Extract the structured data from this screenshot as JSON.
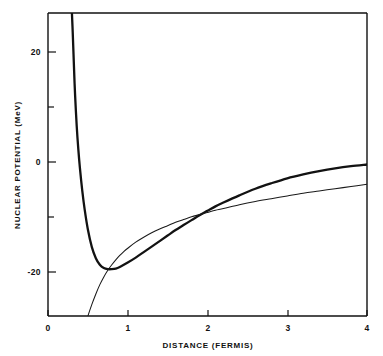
{
  "chart_data": {
    "type": "line",
    "title": "",
    "xlabel": "DISTANCE (FERMIS)",
    "ylabel": "NUCLEAR POTENTIAL (MeV)",
    "xlim": [
      0,
      4
    ],
    "ylim": [
      -27.5,
      27.5
    ],
    "grid": false,
    "legend": "none",
    "xticks": [
      0,
      1,
      2,
      3,
      4
    ],
    "xticklabels": [
      "0",
      "1",
      "2",
      "3",
      "4"
    ],
    "yticks": [
      -20,
      -10,
      0,
      10,
      20
    ],
    "yticklabels": [
      "-20",
      "",
      "0",
      "",
      "20"
    ],
    "y_major_labeled": [
      "20",
      "0",
      "-20"
    ],
    "y_minor_unlabeled": [
      10,
      -10
    ],
    "series": [
      {
        "name": "hard-core-potential",
        "style": "thick",
        "description": "Repulsive hard core near 0.3 fermis, attractive well minimum about -19 MeV near 0.8 fermis, tending to 0 MeV at large distance",
        "x": [
          0.3,
          0.31,
          0.32,
          0.33,
          0.34,
          0.36,
          0.38,
          0.4,
          0.43,
          0.46,
          0.5,
          0.55,
          0.6,
          0.65,
          0.7,
          0.75,
          0.8,
          0.85,
          0.9,
          1.0,
          1.1,
          1.2,
          1.3,
          1.4,
          1.5,
          1.6,
          1.7,
          1.8,
          1.9,
          2.0,
          2.1,
          2.2,
          2.4,
          2.6,
          2.8,
          3.0,
          3.2,
          3.4,
          3.6,
          3.8,
          4.0
        ],
        "y": [
          27.5,
          24.0,
          20.0,
          16.0,
          12.5,
          7.0,
          2.8,
          -0.6,
          -4.8,
          -8.2,
          -11.8,
          -15.0,
          -17.0,
          -18.2,
          -18.8,
          -19.0,
          -19.0,
          -18.9,
          -18.6,
          -17.8,
          -16.9,
          -15.9,
          -14.9,
          -13.9,
          -12.9,
          -11.9,
          -11.0,
          -10.1,
          -9.2,
          -8.4,
          -7.6,
          -6.9,
          -5.6,
          -4.4,
          -3.4,
          -2.5,
          -1.8,
          -1.2,
          -0.7,
          -0.3,
          0.0
        ]
      },
      {
        "name": "soft-potential",
        "style": "thin",
        "description": "Monotonic attractive potential rising from below -27 MeV near 0.5 fermis to about -3.5 MeV at 4 fermis",
        "x": [
          0.5,
          0.55,
          0.6,
          0.65,
          0.7,
          0.75,
          0.8,
          0.85,
          0.9,
          0.95,
          1.0,
          1.1,
          1.2,
          1.3,
          1.4,
          1.5,
          1.6,
          1.7,
          1.8,
          1.9,
          2.0,
          2.1,
          2.2,
          2.4,
          2.6,
          2.8,
          3.0,
          3.2,
          3.4,
          3.6,
          3.8,
          4.0
        ],
        "y": [
          -27.5,
          -25.4,
          -23.5,
          -21.8,
          -20.4,
          -19.2,
          -18.2,
          -17.3,
          -16.5,
          -15.8,
          -15.2,
          -14.1,
          -13.2,
          -12.4,
          -11.7,
          -11.1,
          -10.5,
          -10.0,
          -9.5,
          -9.1,
          -8.7,
          -8.3,
          -8.0,
          -7.3,
          -6.7,
          -6.2,
          -5.7,
          -5.2,
          -4.8,
          -4.4,
          -4.0,
          -3.6
        ]
      }
    ],
    "annotations": {
      "curve_crossing_1": {
        "x": 0.83,
        "y": -18.9
      },
      "curve_crossing_2": {
        "x": 2.15,
        "y": -7.3
      },
      "well_minimum": {
        "x": 0.8,
        "y": -19.0
      },
      "hard_core_radius": 0.3
    }
  },
  "axes": {
    "x_title": "DISTANCE (FERMIS)",
    "y_title": "NUCLEAR POTENTIAL (MeV)",
    "x_tick_labels": [
      "0",
      "1",
      "2",
      "3",
      "4"
    ],
    "y_tick_labels": [
      "20",
      "0",
      "-20"
    ]
  },
  "colors": {
    "background": "#ffffff",
    "ink": "#111111",
    "curve_thick": "#121212",
    "curve_thin": "#1a1a1a"
  }
}
